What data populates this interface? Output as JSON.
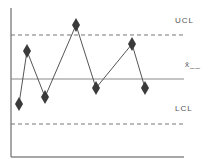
{
  "chart_data": {
    "type": "line",
    "title": "",
    "subtitle": "",
    "xlabel": "",
    "ylabel": "",
    "grid": false,
    "legend": "none",
    "marker": "diamond",
    "x": [
      1,
      2,
      3,
      4,
      5,
      6,
      7
    ],
    "x_px": [
      19,
      27,
      45,
      76,
      96,
      132,
      145
    ],
    "y_px": [
      104,
      51,
      97,
      25,
      88,
      44,
      88
    ],
    "series": [
      {
        "name": "samples",
        "values": [
          -0.56,
          0.63,
          -0.4,
          1.2,
          -0.2,
          0.78,
          -0.2
        ]
      }
    ],
    "control_lines": [
      {
        "name": "UCL",
        "label": "UCL",
        "value": 1.0,
        "style": "dashed",
        "y_px": 35
      },
      {
        "name": "center",
        "label": "x̄",
        "value": 0.0,
        "style": "solid",
        "y_px": 79
      },
      {
        "name": "LCL",
        "label": "LCL",
        "value": -1.0,
        "style": "dashed",
        "y_px": 124
      }
    ],
    "ylim": [
      -1.75,
      1.6
    ],
    "colors": {
      "axis": "#8a8a8a",
      "line": "#555555",
      "marker": "#3a3a3a",
      "control": "#777777"
    }
  },
  "labels": {
    "ucl": "UCL",
    "center": "x̄__",
    "lcl": "LCL"
  }
}
